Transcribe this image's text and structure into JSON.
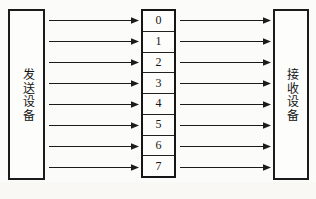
{
  "figure": {
    "background_color": "#fbfbf9",
    "stroke_color": "#1b1b1b"
  },
  "sender": {
    "label": "发送设备",
    "orientation": "vertical"
  },
  "receiver": {
    "label": "接收设备",
    "orientation": "vertical"
  },
  "line_stack": {
    "name": "transmission-lines",
    "cells": [
      {
        "label": "0"
      },
      {
        "label": "1"
      },
      {
        "label": "2"
      },
      {
        "label": "3"
      },
      {
        "label": "4"
      },
      {
        "label": "5"
      },
      {
        "label": "6"
      },
      {
        "label": "7"
      }
    ]
  },
  "arrows": {
    "left_group_count": 8,
    "right_group_count": 8,
    "direction": "left-to-right",
    "head_style": "solid-triangle"
  },
  "chart_data": {
    "type": "diagram",
    "nodes": [
      {
        "id": "sender",
        "label": "发送设备",
        "x": 8,
        "y": 9,
        "w": 37,
        "h": 171
      },
      {
        "id": "channel",
        "label": "",
        "x": 141,
        "y": 9,
        "w": 35,
        "h": 169
      },
      {
        "id": "receiver",
        "label": "接收设备",
        "x": 273,
        "y": 9,
        "w": 36,
        "h": 171
      }
    ],
    "channel_lines": [
      "0",
      "1",
      "2",
      "3",
      "4",
      "5",
      "6",
      "7"
    ],
    "edges": [
      {
        "from": "sender",
        "to": "channel",
        "line": "0"
      },
      {
        "from": "sender",
        "to": "channel",
        "line": "1"
      },
      {
        "from": "sender",
        "to": "channel",
        "line": "2"
      },
      {
        "from": "sender",
        "to": "channel",
        "line": "3"
      },
      {
        "from": "sender",
        "to": "channel",
        "line": "4"
      },
      {
        "from": "sender",
        "to": "channel",
        "line": "5"
      },
      {
        "from": "sender",
        "to": "channel",
        "line": "6"
      },
      {
        "from": "sender",
        "to": "channel",
        "line": "7"
      },
      {
        "from": "channel",
        "to": "receiver",
        "line": "0"
      },
      {
        "from": "channel",
        "to": "receiver",
        "line": "1"
      },
      {
        "from": "channel",
        "to": "receiver",
        "line": "2"
      },
      {
        "from": "channel",
        "to": "receiver",
        "line": "3"
      },
      {
        "from": "channel",
        "to": "receiver",
        "line": "4"
      },
      {
        "from": "channel",
        "to": "receiver",
        "line": "5"
      },
      {
        "from": "channel",
        "to": "receiver",
        "line": "6"
      },
      {
        "from": "channel",
        "to": "receiver",
        "line": "7"
      }
    ]
  }
}
